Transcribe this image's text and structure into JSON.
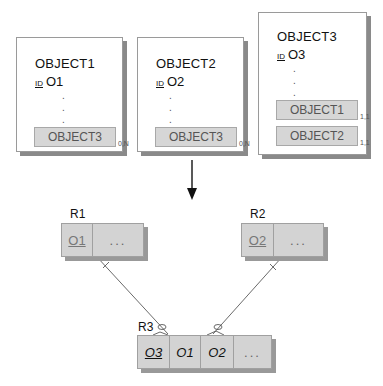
{
  "objects": [
    {
      "name": "OBJECT1",
      "id_label": "ID",
      "id": "O1",
      "refs": [
        {
          "label": "OBJECT3",
          "card": "0,N"
        }
      ]
    },
    {
      "name": "OBJECT2",
      "id_label": "ID",
      "id": "O2",
      "refs": [
        {
          "label": "OBJECT3",
          "card": "0,N"
        }
      ]
    },
    {
      "name": "OBJECT3",
      "id_label": "ID",
      "id": "O3",
      "refs": [
        {
          "label": "OBJECT1",
          "card": "1,1"
        },
        {
          "label": "OBJECT2",
          "card": "1,1"
        }
      ]
    }
  ],
  "dots": ".",
  "relations": [
    {
      "name": "R1",
      "cells": [
        "O1",
        "..."
      ]
    },
    {
      "name": "R2",
      "cells": [
        "O2",
        "..."
      ]
    },
    {
      "name": "R3",
      "cells": [
        "O3",
        "O1",
        "O2",
        "..."
      ]
    }
  ]
}
